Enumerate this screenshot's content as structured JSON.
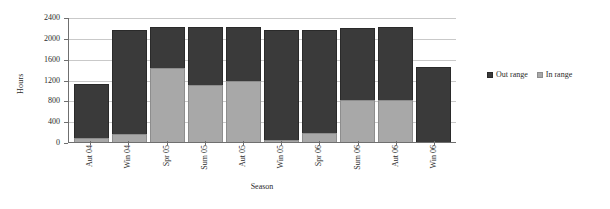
{
  "chart_data": {
    "type": "bar",
    "stacked": true,
    "title": "",
    "xlabel": "Season",
    "ylabel": "Hours",
    "ylim": [
      0,
      2400
    ],
    "yticks": [
      0,
      400,
      800,
      1200,
      1600,
      2000,
      2400
    ],
    "grid": true,
    "legend_position": "right",
    "categories": [
      "Aut 04",
      "Win 04",
      "Spr 05",
      "Sum 05",
      "Aut 05",
      "Win 05",
      "Spr 06",
      "Sum 06",
      "Aut 06",
      "Win 06"
    ],
    "series": [
      {
        "name": "In range",
        "color": "#a8a8a8",
        "values": [
          70,
          150,
          1430,
          1090,
          1180,
          40,
          170,
          800,
          800,
          0
        ]
      },
      {
        "name": "Out range",
        "color": "#3a3a3a",
        "values": [
          1050,
          2010,
          780,
          1120,
          1030,
          2110,
          1990,
          1380,
          1400,
          1440
        ]
      }
    ],
    "totals": [
      1120,
      2160,
      2210,
      2210,
      2210,
      2150,
      2160,
      2180,
      2200,
      1440
    ]
  },
  "legend": {
    "items": [
      {
        "label": "Out range",
        "swatch": "out-range-swatch"
      },
      {
        "label": "In range",
        "swatch": "in-range-swatch"
      }
    ]
  },
  "axes": {
    "y_title": "Hours",
    "x_title": "Season",
    "y_tick_labels": [
      "2400",
      "2000",
      "1600",
      "1200",
      "800",
      "400",
      "0"
    ],
    "x_tick_labels": [
      "Aut 04",
      "Win 04",
      "Spr 05",
      "Sum 05",
      "Aut 05",
      "Win 05",
      "Spr 06",
      "Sum 06",
      "Aut 06",
      "Win 06"
    ]
  }
}
